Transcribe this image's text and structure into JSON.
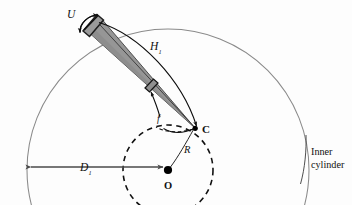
{
  "figure": {
    "type": "geometry-diagram",
    "background_color": "#fdfdfd",
    "line_color": "#3a3a3a",
    "outer_arc_color": "#8a8a8a",
    "wedge_fill": "#969696",
    "wedge_edge": "#2b2b2b",
    "dashed_color": "#111111",
    "dimension_color": "#5a5a5a"
  },
  "labels": {
    "u": "U",
    "h_main": "H",
    "h_sub": "1",
    "c": "C",
    "r": "R",
    "o": "O",
    "d_main": "D",
    "d_sub": "1",
    "angle": "f",
    "inner_cylinder_line1": "Inner",
    "inner_cylinder_line2": "cylinder"
  },
  "geometry": {
    "outer_circle": {
      "cx": 168,
      "cy": 170,
      "r": 141
    },
    "dashed_circle": {
      "cx": 168,
      "cy": 170,
      "r": 45
    },
    "point_o": {
      "x": 168,
      "y": 170
    },
    "point_c": {
      "x": 195,
      "y": 128
    },
    "wedge_apex": {
      "x": 195,
      "y": 128
    },
    "wedge_far_a": {
      "x": 84,
      "y": 28
    },
    "wedge_far_b": {
      "x": 98,
      "y": 16
    },
    "dimension_line": {
      "x1": 27,
      "x2": 168,
      "y": 167
    }
  }
}
